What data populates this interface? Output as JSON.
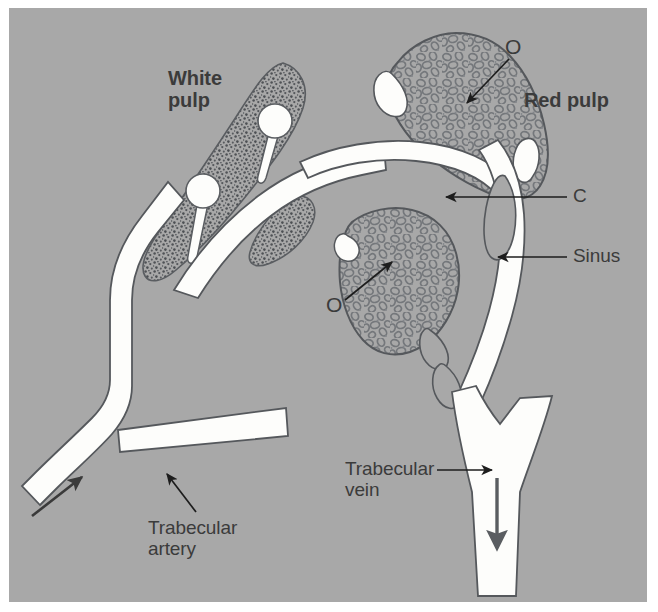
{
  "figure": {
    "kind": "anatomical-diagram",
    "background_color": "#a8a8a8",
    "plate_border_color": "#ffffff",
    "vessel_fill_color": "#fdfdfb",
    "tissue_fill_color": "#a8a8a8",
    "outline_color": "#55555a",
    "cell_outline_color": "#6f7276",
    "stipple_color": "#53565a",
    "label_color": "#3b3b3b"
  },
  "labels": {
    "white_pulp": "White\npulp",
    "red_pulp": "Red pulp",
    "o_upper": "O",
    "o_lower": "O",
    "c": "C",
    "sinus": "Sinus",
    "trabecular_vein": "Trabecular\nvein",
    "trabecular_artery": "Trabecular\nartery"
  },
  "annotations": [
    {
      "name": "o-upper-leader",
      "label": "O",
      "arrow": "down-left",
      "target": "red pulp cords (upper)"
    },
    {
      "name": "o-lower-leader",
      "label": "O",
      "arrow": "up-right",
      "target": "red pulp cords (lower)"
    },
    {
      "name": "c-leader",
      "label": "C",
      "arrow": "left",
      "target": "capillary / white channel"
    },
    {
      "name": "sinus-leader",
      "label": "Sinus",
      "arrow": "left",
      "target": "venous sinus"
    },
    {
      "name": "trabecular-vein-leader",
      "label": "Trabecular\nvein",
      "arrow": "right",
      "target": "trabecular vein lumen"
    },
    {
      "name": "trabecular-artery-leader",
      "label": "Trabecular\nartery",
      "arrow": "up-left",
      "target": "trabecular artery lumen"
    }
  ],
  "flow_arrows": [
    {
      "name": "arterial-inflow-arrow",
      "direction": "up-right",
      "vessel": "trabecular artery"
    },
    {
      "name": "venous-outflow-arrow",
      "direction": "down",
      "vessel": "trabecular vein"
    }
  ],
  "structures": [
    {
      "name": "white-pulp-region",
      "texture": "stipple",
      "note": "two pale lymphoid follicles on arterioles"
    },
    {
      "name": "red-pulp-region-upper",
      "texture": "cellular",
      "note": "splenic cords"
    },
    {
      "name": "red-pulp-region-lower",
      "texture": "cellular",
      "note": "splenic cords"
    },
    {
      "name": "trabecular-artery",
      "texture": "lumen"
    },
    {
      "name": "trabecular-vein",
      "texture": "lumen"
    },
    {
      "name": "venous-sinuses",
      "texture": "lumen"
    }
  ]
}
